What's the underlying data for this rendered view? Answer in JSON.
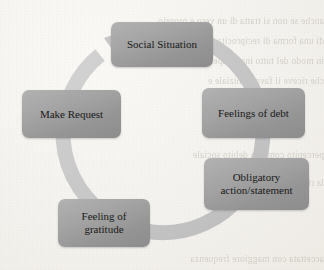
{
  "diagram": {
    "type": "cycle",
    "direction": "clockwise",
    "title": "",
    "arrow_color": "#c9c9c9",
    "node_color": "#a2a2a2",
    "text_color": "#181818",
    "background_color": "#f5f3ef",
    "nodes": [
      {
        "id": "social",
        "label": "Social Situation"
      },
      {
        "id": "debt",
        "label": "Feelings of debt"
      },
      {
        "id": "oblig",
        "label_line1": "Obligatory",
        "label_line2": "action/statement"
      },
      {
        "id": "grat",
        "label_line1": "Feeling of",
        "label_line2": "gratitude"
      },
      {
        "id": "make",
        "label": "Make Request"
      }
    ]
  },
  "bleed_text": {
    "line1": "anche se non si tratta di un vero e proprio",
    "line2": "di una forma di reciprocita che viene",
    "line3": "in modo del tutto inconsapevole dal",
    "line4": "che riceve il favore iniziale e",
    "line5": "percepito come un debito sociale",
    "line6": "la richiesta successiva viene",
    "line7": "accettata con maggiore frequenza"
  }
}
